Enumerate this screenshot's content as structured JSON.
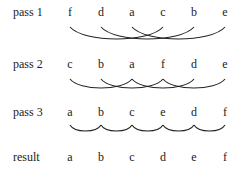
{
  "columns_x": [
    70,
    101,
    132,
    163,
    194,
    225
  ],
  "rows": [
    {
      "label": "pass 1",
      "letters": [
        "f",
        "d",
        "a",
        "c",
        "b",
        "e"
      ],
      "top": 5,
      "arcs": [
        [
          0,
          3
        ],
        [
          1,
          4
        ],
        [
          2,
          5
        ]
      ],
      "arc_y": 27,
      "arc_depth": 16
    },
    {
      "label": "pass 2",
      "letters": [
        "c",
        "b",
        "a",
        "f",
        "d",
        "e"
      ],
      "top": 57,
      "arcs": [
        [
          0,
          2
        ],
        [
          2,
          4
        ],
        [
          1,
          3
        ],
        [
          3,
          5
        ]
      ],
      "arc_y": 79,
      "arc_depth": 12
    },
    {
      "label": "pass 3",
      "letters": [
        "a",
        "b",
        "c",
        "e",
        "d",
        "f"
      ],
      "top": 105,
      "arcs": [
        [
          0,
          1
        ],
        [
          1,
          2
        ],
        [
          2,
          3
        ],
        [
          3,
          4
        ],
        [
          4,
          5
        ]
      ],
      "arc_y": 125,
      "arc_depth": 8
    },
    {
      "label": "result",
      "letters": [
        "a",
        "b",
        "c",
        "d",
        "e",
        "f"
      ],
      "top": 150,
      "arcs": [],
      "arc_y": 0,
      "arc_depth": 0
    }
  ]
}
